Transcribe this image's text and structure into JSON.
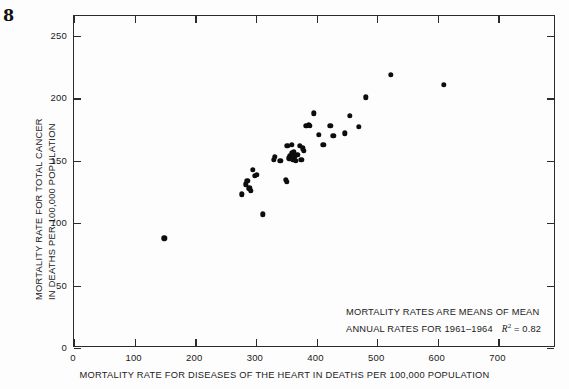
{
  "figure": {
    "number": "8"
  },
  "axes": {
    "x_ticks": [
      0,
      100,
      200,
      300,
      400,
      500,
      600,
      700
    ],
    "y_ticks": [
      0,
      50,
      100,
      150,
      200,
      250
    ]
  },
  "annotation": {
    "line1": "MORTALITY RATES ARE MEANS OF MEAN",
    "line2_prefix": "ANNUAL RATES FOR 1961–1964",
    "r2_symbol": "R",
    "r2_exponent": "2",
    "r2_value": "= 0.82"
  },
  "chart_data": {
    "type": "scatter",
    "title": "",
    "xlabel": "MORTALITY RATE FOR DISEASES OF THE HEART IN DEATHS PER 100,000 POPULATION",
    "ylabel_line1": "MORTALITY RATE FOR TOTAL CANCER",
    "ylabel_line2": "IN DEATHS PER 100,000 POPULATION",
    "xlim": [
      0,
      795
    ],
    "ylim": [
      0,
      266
    ],
    "xticks": [
      0,
      100,
      200,
      300,
      400,
      500,
      600,
      700
    ],
    "yticks": [
      0,
      50,
      100,
      150,
      200,
      250
    ],
    "grid": false,
    "legend": null,
    "r_squared": 0.82,
    "period": "1961-1964",
    "points": [
      [
        149,
        88
      ],
      [
        277,
        123
      ],
      [
        283,
        131
      ],
      [
        286,
        134
      ],
      [
        289,
        128
      ],
      [
        292,
        126
      ],
      [
        295,
        143
      ],
      [
        298,
        138
      ],
      [
        302,
        139
      ],
      [
        311,
        107
      ],
      [
        330,
        151
      ],
      [
        331,
        153
      ],
      [
        340,
        150
      ],
      [
        349,
        135
      ],
      [
        351,
        133
      ],
      [
        352,
        162
      ],
      [
        355,
        152
      ],
      [
        357,
        154
      ],
      [
        359,
        163
      ],
      [
        360,
        156
      ],
      [
        361,
        152
      ],
      [
        362,
        151
      ],
      [
        363,
        157
      ],
      [
        364,
        153
      ],
      [
        366,
        150
      ],
      [
        368,
        155
      ],
      [
        372,
        162
      ],
      [
        375,
        151
      ],
      [
        377,
        160
      ],
      [
        379,
        158
      ],
      [
        383,
        178
      ],
      [
        387,
        179
      ],
      [
        389,
        178
      ],
      [
        396,
        188
      ],
      [
        404,
        171
      ],
      [
        411,
        163
      ],
      [
        423,
        178
      ],
      [
        428,
        170
      ],
      [
        447,
        172
      ],
      [
        455,
        186
      ],
      [
        470,
        177
      ],
      [
        481,
        201
      ],
      [
        523,
        219
      ],
      [
        610,
        211
      ]
    ]
  }
}
